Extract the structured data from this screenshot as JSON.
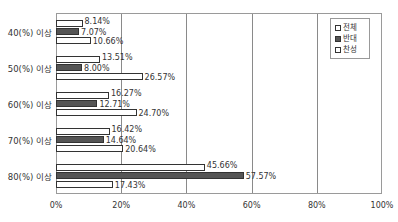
{
  "chart_data": {
    "type": "bar",
    "orientation": "horizontal",
    "title": "",
    "xlabel": "",
    "ylabel": "",
    "categories": [
      "40(%) 이상",
      "50(%) 이상",
      "60(%) 이상",
      "70(%) 이상",
      "80(%) 이상"
    ],
    "series": [
      {
        "name": "전체",
        "color": "#ffffff",
        "values": [
          8.14,
          13.51,
          16.27,
          16.42,
          45.66
        ]
      },
      {
        "name": "반대",
        "color": "#555555",
        "values": [
          7.07,
          8.0,
          12.71,
          14.64,
          57.57
        ]
      },
      {
        "name": "찬성",
        "color": "#ffffff",
        "values": [
          10.66,
          26.57,
          24.7,
          20.64,
          17.43
        ]
      }
    ],
    "value_labels": [
      [
        "8.14%",
        "7.07%",
        "10.66%"
      ],
      [
        "13.51%",
        "8.00%",
        "26.57%"
      ],
      [
        "16.27%",
        "12.71%",
        "24.70%"
      ],
      [
        "16.42%",
        "14.64%",
        "20.64%"
      ],
      [
        "45.66%",
        "57.57%",
        "17.43%"
      ]
    ],
    "x_ticks": [
      "0%",
      "20%",
      "40%",
      "60%",
      "80%",
      "100%"
    ],
    "xlim": [
      0,
      100
    ],
    "grid": true,
    "legend_position": "top-right"
  }
}
